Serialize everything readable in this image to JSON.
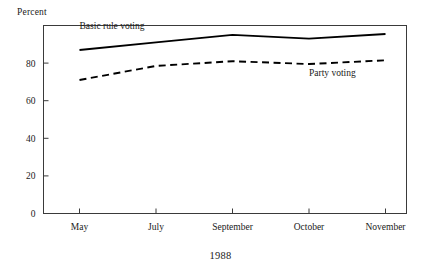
{
  "figure": {
    "percent_axis_label": "Percent",
    "year_label": "1988"
  },
  "chart_data": {
    "type": "line",
    "title": "",
    "subtitle": "",
    "xlabel": "1988",
    "ylabel": "Percent",
    "categories": [
      "May",
      "July",
      "September",
      "October",
      "November"
    ],
    "yticks": [
      0,
      20,
      40,
      60,
      80
    ],
    "ytick_labels": [
      "0",
      "20",
      "40",
      "60",
      "80"
    ],
    "ylim": [
      0,
      100
    ],
    "grid": false,
    "legend": "inline-annotations",
    "series": [
      {
        "name": "Basic rule voting",
        "style": "solid",
        "color": "#000000",
        "label_position": "above-left",
        "values": [
          87,
          91,
          95,
          93,
          95.5
        ]
      },
      {
        "name": "Party voting",
        "style": "dashed",
        "color": "#000000",
        "label_position": "below-right",
        "values": [
          71,
          78.5,
          81,
          79.5,
          81.5
        ]
      }
    ],
    "annotations": [
      {
        "text": "Basic rule voting",
        "x_category": "May",
        "y_value": 98
      },
      {
        "text": "Party voting",
        "x_category": "October",
        "y_value": 73
      }
    ]
  }
}
